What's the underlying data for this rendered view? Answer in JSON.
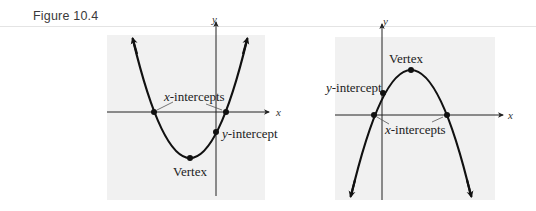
{
  "caption": "Figure 10.4",
  "left_graph": {
    "axis_x_label": "x",
    "axis_y_label": "y",
    "label_x_intercepts_var": "x",
    "label_x_intercepts_text": "-intercepts",
    "label_y_intercept_var": "y",
    "label_y_intercept_text": "-intercept",
    "label_vertex": "Vertex",
    "orientation": "opens upward"
  },
  "right_graph": {
    "axis_x_label": "x",
    "axis_y_label": "y",
    "label_x_intercepts_var": "x",
    "label_x_intercepts_text": "-intercepts",
    "label_y_intercept_var": "y",
    "label_y_intercept_text": "-intercept",
    "label_vertex": "Vertex",
    "orientation": "opens downward"
  },
  "colors": {
    "panel_bg": "#f1f1f1",
    "curve": "#111111",
    "axis": "#222222"
  }
}
